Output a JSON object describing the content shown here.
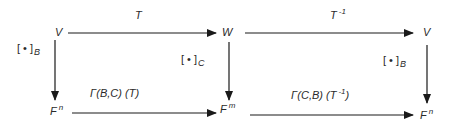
{
  "diagram": {
    "type": "commutative-diagram",
    "nodes": {
      "v_left": {
        "base": "V",
        "sup": ""
      },
      "w": {
        "base": "W",
        "sup": ""
      },
      "v_right": {
        "base": "V",
        "sup": ""
      },
      "f_n_left": {
        "base": "F",
        "sup": "n"
      },
      "f_m": {
        "base": "F",
        "sup": "m"
      },
      "f_n_right": {
        "base": "F",
        "sup": "n"
      }
    },
    "edges": {
      "top_left": {
        "label": "T",
        "sup": ""
      },
      "top_right": {
        "label": "T",
        "sup": "-1"
      },
      "bottom_left": {
        "label": "Γ(B,C) (T)",
        "pre": "Γ(B,C) (T",
        "sup": "",
        "post": ")"
      },
      "bottom_right": {
        "label": "Γ(C,B) (T⁻¹)",
        "pre": "Γ(C,B) (T",
        "sup": "-1",
        "post": ")"
      },
      "vert_left": {
        "bracket": "[ • ]",
        "sub": "B"
      },
      "vert_mid": {
        "bracket": "[ • ]",
        "sub": "C"
      },
      "vert_right": {
        "bracket": "[ • ]",
        "sub": "B"
      }
    },
    "colors": {
      "stroke": "#1a1a1a",
      "text": "#2a2a2a",
      "background": "#ffffff"
    }
  }
}
